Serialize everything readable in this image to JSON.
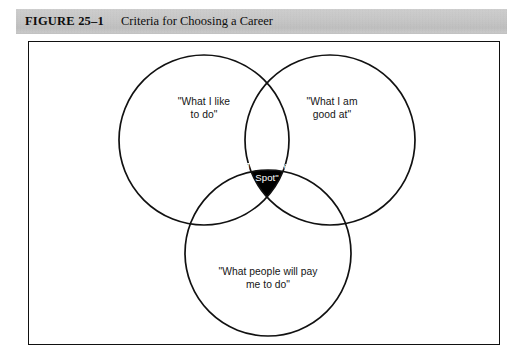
{
  "header": {
    "figure_label": "FIGURE 25–1",
    "figure_title": "Criteria for Choosing a Career",
    "band_color": "#c6c6c6"
  },
  "figure": {
    "frame_color": "#111111",
    "background_color": "#ffffff"
  },
  "venn": {
    "circle_stroke_color": "#111111",
    "intersection_fill_color": "#000000",
    "intersection_text_color": "#ffffff",
    "circles": [
      {
        "name": "what-i-like-to-do",
        "label": "\"What I like\nto do\"",
        "cx": 204,
        "cy": 140,
        "r": 85
      },
      {
        "name": "what-i-am-good-at",
        "label": "\"What I am\ngood at\"",
        "cx": 330,
        "cy": 140,
        "r": 85
      },
      {
        "name": "what-people-will-pay-me-to-do",
        "label": "\"What people will pay\nme to do\"",
        "cx": 268,
        "cy": 253,
        "r": 83
      }
    ],
    "center": {
      "name": "the-sweet-spot",
      "label": "\"The Sweet\nSpot\""
    }
  }
}
